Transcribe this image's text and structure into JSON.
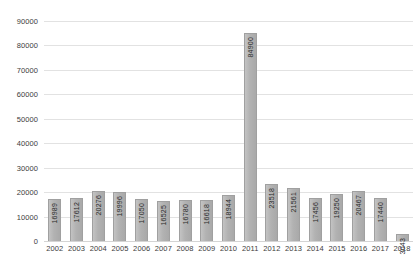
{
  "chart_data": {
    "type": "bar",
    "title": "",
    "subtitle": "",
    "xlabel": "",
    "ylabel": "",
    "categories": [
      "2002",
      "2003",
      "2004",
      "2005",
      "2006",
      "2007",
      "2008",
      "2009",
      "2010",
      "2011",
      "2012",
      "2013",
      "2014",
      "2015",
      "2016",
      "2017",
      "2018"
    ],
    "values": [
      16989,
      17612,
      20276,
      19996,
      17050,
      16525,
      16780,
      16618,
      18944,
      84900,
      23518,
      21561,
      17456,
      19250,
      20467,
      17440,
      3043
    ],
    "value_labels": [
      "16989",
      "17612",
      "20276",
      "19996",
      "17050",
      "16525",
      "16780",
      "16618",
      "18944",
      "84900",
      "23518",
      "21561",
      "17456",
      "19250",
      "20467",
      "17440",
      "3043"
    ],
    "ylim": [
      0,
      90000
    ],
    "ytick_step": 10000,
    "ytick_labels": [
      "0",
      "10000",
      "20000",
      "30000",
      "40000",
      "50000",
      "60000",
      "70000",
      "80000",
      "90000"
    ],
    "grid": true,
    "legend": false,
    "legend_position": "none",
    "series": [
      {
        "name": "",
        "values": [
          16989,
          17612,
          20276,
          19996,
          17050,
          16525,
          16780,
          16618,
          18944,
          84900,
          23518,
          21561,
          17456,
          19250,
          20467,
          17440,
          3043
        ]
      }
    ],
    "colors": {
      "bar_fill": "#b2b2b2",
      "bar_border": "#a0a0a0",
      "gridline": "#e2e2e2",
      "axis_text": "#3c3c3c",
      "background": "#ffffff"
    }
  }
}
